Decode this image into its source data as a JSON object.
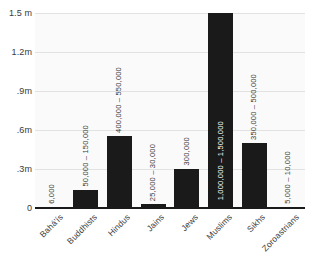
{
  "chart_data": {
    "type": "bar",
    "title": "",
    "subtitle": "",
    "xlabel": "",
    "ylabel": "",
    "grid": true,
    "legend": false,
    "ylim": [
      0,
      1500000
    ],
    "yticks": [
      0,
      300000,
      600000,
      900000,
      1200000,
      1500000
    ],
    "ytick_labels": [
      "0",
      ".3m",
      ".6m",
      ".9m",
      "1.2m",
      "1.5 m"
    ],
    "categories": [
      "Bahá'ís",
      "Buddhists",
      "Hindus",
      "Jains",
      "Jews",
      "Muslims",
      "Sikhs",
      "Zoroastrians"
    ],
    "values": [
      6000,
      140000,
      555000,
      30000,
      300000,
      1500000,
      500000,
      10000
    ],
    "value_labels": [
      "6,000",
      "50,000 – 150,000",
      "400,000 – 550,000",
      "25,000 – 30,000",
      "300,000",
      "1,000,000 – 1,500,000",
      "350,000 – 500,000",
      "5,000 – 10,000"
    ],
    "label_inside": [
      false,
      false,
      false,
      false,
      false,
      true,
      false,
      false
    ],
    "series": [
      {
        "name": "Population",
        "values": [
          6000,
          140000,
          555000,
          30000,
          300000,
          1500000,
          500000,
          10000
        ]
      }
    ],
    "colors": {
      "bar": "#1a1a1a",
      "plot_background": "#fafafa",
      "gridline": "#e2e2e2",
      "axis": "#1a1a1a",
      "tick_text": "#3a3a3a",
      "inside_label": "#ffffff",
      "page_background": "#ffffff"
    }
  }
}
